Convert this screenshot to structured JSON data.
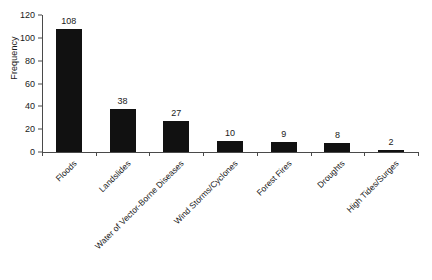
{
  "chart_data": {
    "type": "bar",
    "title": "",
    "xlabel": "",
    "ylabel": "Frequency",
    "categories": [
      "Floods",
      "Landslides",
      "Water of Vector-Borne Diseases",
      "Wind Storms/Cyclones",
      "Forest Fires",
      "Droughts",
      "High Tides/Surges"
    ],
    "values": [
      108,
      38,
      27,
      10,
      9,
      8,
      2
    ],
    "value_labels": [
      "108",
      "38",
      "27",
      "10",
      "9",
      "8",
      "2"
    ],
    "ylim": [
      0,
      120
    ],
    "yticks": [
      0,
      20,
      40,
      60,
      80,
      100,
      120
    ],
    "ytick_labels": [
      "0",
      "20",
      "40",
      "60",
      "80",
      "100",
      "120"
    ],
    "grid": false,
    "legend": false,
    "legend_position": "none",
    "bar_color": "#111111",
    "axis_color": "#4a4a4a",
    "background_color": "#ffffff",
    "x_label_rotation_deg": -45,
    "show_value_labels": true
  }
}
